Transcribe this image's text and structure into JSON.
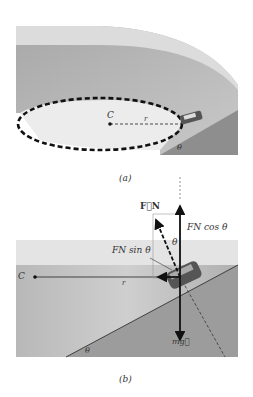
{
  "panel_a": {
    "caption": "(a)",
    "labels": {
      "center": "C",
      "radius": "r",
      "angle": "θ"
    }
  },
  "panel_b": {
    "caption": "(b)",
    "labels": {
      "center": "C",
      "radius": "r",
      "normal_force": "F⃗N",
      "normal_cos": "FN cos θ",
      "normal_sin": "FN sin θ",
      "angle_top": "θ",
      "angle_bottom": "θ",
      "weight": "mg⃗"
    }
  },
  "colors": {
    "surface_dark": "#9a9a9a",
    "surface_mid": "#bdbdbd",
    "surface_light": "#e8e8e8",
    "ink": "#111111"
  }
}
